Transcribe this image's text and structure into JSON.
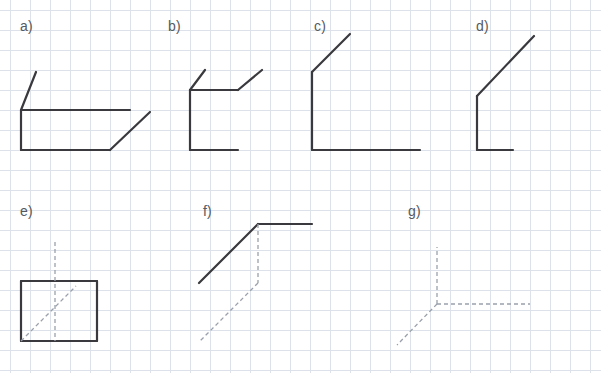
{
  "canvas": {
    "width": 601,
    "height": 373,
    "background_color": "#ffffff",
    "grid": {
      "visible": true,
      "cell_size": 20,
      "line_color": "#dde2ea",
      "origin_offset_x": -10,
      "origin_offset_y": -10
    }
  },
  "style": {
    "stroke_color": "#3a3a3e",
    "solid_width": 2.2,
    "dashed_color": "#9aa0ab",
    "dashed_width": 1.3,
    "dash_pattern": "4 3"
  },
  "figures": [
    {
      "id": "a",
      "label": "a)",
      "label_x": 20,
      "label_y": 18,
      "description": "open box in oblique projection with two receding edges",
      "solid_paths": [
        "M 36,72 L 21,110",
        "M 21,110 L 21,150",
        "M 21,110 L 130,110",
        "M 21,150 L 110,150",
        "M 110,150 L 150,112"
      ],
      "dashed_paths": []
    },
    {
      "id": "b",
      "label": "b)",
      "label_x": 168,
      "label_y": 18,
      "description": "open box with two short receding edges",
      "solid_paths": [
        "M 205,70 L 190,90",
        "M 190,90 L 190,150",
        "M 190,90 L 238,90",
        "M 190,150 L 238,150",
        "M 238,90 L 262,70"
      ],
      "dashed_paths": []
    },
    {
      "id": "c",
      "label": "c)",
      "label_x": 314,
      "label_y": 18,
      "description": "L-shape with long receding diagonal at top",
      "solid_paths": [
        "M 350,34 L 312,72",
        "M 312,72 L 312,150",
        "M 312,150 L 420,150"
      ],
      "dashed_paths": []
    },
    {
      "id": "d",
      "label": "d)",
      "label_x": 476,
      "label_y": 18,
      "description": "small L-shape with long receding diagonal",
      "solid_paths": [
        "M 534,36 L 477,96",
        "M 477,96 L 477,150",
        "M 477,150 L 513,150"
      ],
      "dashed_paths": []
    },
    {
      "id": "e",
      "label": "e)",
      "label_x": 20,
      "label_y": 203,
      "description": "solid rectangle with dashed vertical axis and dashed diagonal axis",
      "solid_paths": [
        "M 21,281 L 97,281",
        "M 97,281 L 97,341",
        "M 97,341 L 21,341",
        "M 21,341 L 21,281"
      ],
      "dashed_paths": [
        "M 55,242 L 55,341",
        "M 21,341 L 76,286"
      ]
    },
    {
      "id": "f",
      "label": "f)",
      "label_x": 203,
      "label_y": 203,
      "description": "solid diagonal and horizontal with dashed vertical and dashed diagonal",
      "solid_paths": [
        "M 199,283 L 258,224",
        "M 258,224 L 312,224"
      ],
      "dashed_paths": [
        "M 258,224 L 258,283",
        "M 258,283 L 199,342"
      ]
    },
    {
      "id": "g",
      "label": "g)",
      "label_x": 408,
      "label_y": 203,
      "description": "three dashed axes meeting at an origin point",
      "solid_paths": [],
      "dashed_paths": [
        "M 437,304 L 437,247",
        "M 437,304 L 530,304",
        "M 437,304 L 397,345"
      ]
    }
  ]
}
